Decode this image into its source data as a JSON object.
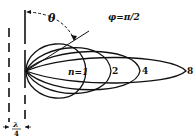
{
  "diagram": {
    "title_label": "φ=π/2",
    "angle_label": "θ",
    "spacing_label_numerator": "λ",
    "spacing_label_denominator": "4",
    "lobes": [
      {
        "n": 1,
        "label": "n=1",
        "reach_x": 86
      },
      {
        "n": 2,
        "label": "2",
        "reach_x": 111
      },
      {
        "n": 4,
        "label": "4",
        "reach_x": 140
      },
      {
        "n": 8,
        "label": "8",
        "reach_x": 186
      }
    ],
    "colors": {
      "ink": "#111111",
      "background": "#ffffff"
    }
  }
}
